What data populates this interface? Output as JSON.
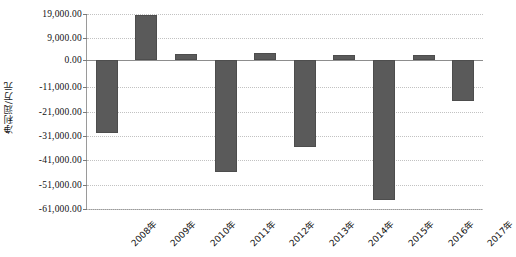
{
  "chart_data": {
    "type": "bar",
    "title": "",
    "subtitle": "",
    "xlabel": "",
    "ylabel": "净利润/万元",
    "categories": [
      "2008年",
      "2009年",
      "2010年",
      "2011年",
      "2012年",
      "2013年",
      "2014年",
      "2015年",
      "2016年",
      "2017年"
    ],
    "values": [
      -30000,
      18500,
      2500,
      -46000,
      3000,
      -35500,
      2000,
      -57500,
      2000,
      -16500
    ],
    "series": [
      {
        "name": "净利润",
        "values": [
          -30000,
          18500,
          2500,
          -46000,
          3000,
          -35500,
          2000,
          -57500,
          2000,
          -16500
        ]
      }
    ],
    "ylim": [
      -61000,
      19000
    ],
    "ytick_values": [
      19000,
      9000,
      0,
      -11000,
      -21000,
      -31000,
      -41000,
      -51000,
      -61000
    ],
    "ytick_labels": [
      "19,000.00",
      "9,000.00",
      "0.00",
      "-11,000.00",
      "-21,000.00",
      "-31,000.00",
      "-41,000.00",
      "-51,000.00",
      "-61,000.00"
    ],
    "grid": true,
    "grid_axis": "y",
    "legend": false,
    "legend_position": "none",
    "bar_color": "#5a5a5a",
    "gridline_color": "#c2c2c2",
    "zero_line_color": "#8d8d8d",
    "axis_color": "#9a9a9a",
    "plot_background": "#ffffff",
    "annotations": []
  }
}
